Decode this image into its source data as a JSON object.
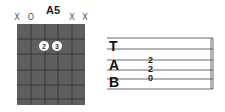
{
  "chord": {
    "name": "A5",
    "string_markers": [
      "X",
      "O",
      "",
      "",
      "X",
      "X"
    ],
    "fingers": [
      {
        "string": 3,
        "fret": 1,
        "label": "2"
      },
      {
        "string": 4,
        "fret": 1,
        "label": "3"
      }
    ],
    "colors": {
      "fretboard": "#5f5f5f",
      "lines": "#3a3a3a",
      "dot": "#ffffff"
    }
  },
  "tab": {
    "letters": [
      "T",
      "A",
      "B"
    ],
    "notes": [
      {
        "line": 3,
        "value": "2"
      },
      {
        "line": 4,
        "value": "2"
      },
      {
        "line": 5,
        "value": "0"
      }
    ]
  }
}
